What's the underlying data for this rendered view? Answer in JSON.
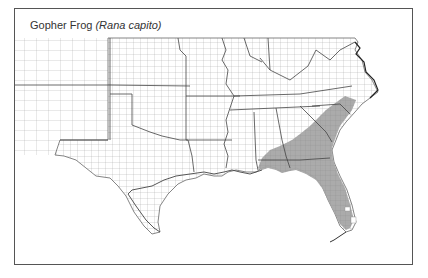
{
  "map": {
    "title": {
      "common_name": "Gopher Frog",
      "scientific_name": "(Rana capito)"
    },
    "region": "Southeastern United States (county-level)",
    "colors": {
      "range_fill": "#a6a6a6",
      "range_fill_dark": "#9a9a9a",
      "county_lines": "#8a8a8a",
      "state_lines": "#444444",
      "frame": "#555555",
      "background": "#ffffff"
    },
    "shaded_range_states": [
      "North Carolina",
      "South Carolina",
      "Georgia",
      "Florida",
      "Alabama",
      "Mississippi"
    ],
    "legend": "none"
  }
}
